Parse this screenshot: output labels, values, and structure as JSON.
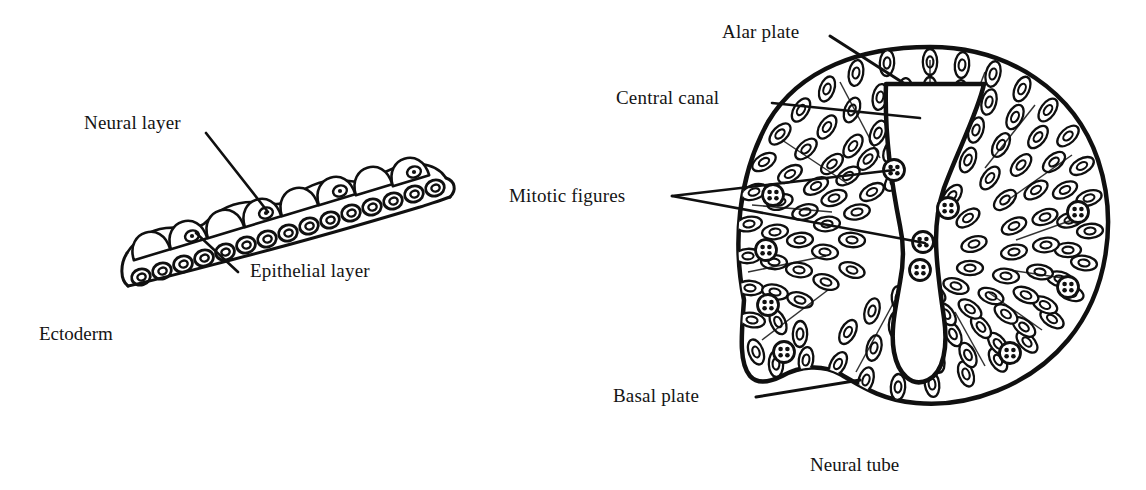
{
  "figure": {
    "background_color": "#ffffff",
    "ink_color": "#111111"
  },
  "panels": [
    {
      "id": "ectoderm-panel",
      "caption": "Ectoderm",
      "labels": [
        {
          "id": "neural-layer",
          "text": "Neural layer"
        },
        {
          "id": "epithelial-layer",
          "text": "Epithelial layer"
        }
      ]
    },
    {
      "id": "neural-tube-panel",
      "caption": "Neural tube",
      "labels": [
        {
          "id": "alar-plate",
          "text": "Alar plate"
        },
        {
          "id": "central-canal",
          "text": "Central canal"
        },
        {
          "id": "mitotic-figures",
          "text": "Mitotic figures"
        },
        {
          "id": "basal-plate",
          "text": "Basal plate"
        }
      ]
    }
  ],
  "labels": {
    "neural_layer": "Neural layer",
    "epithelial_layer": "Epithelial layer",
    "ectoderm": "Ectoderm",
    "alar_plate": "Alar plate",
    "central_canal": "Central canal",
    "mitotic_figures": "Mitotic figures",
    "basal_plate": "Basal plate",
    "neural_tube": "Neural tube"
  }
}
